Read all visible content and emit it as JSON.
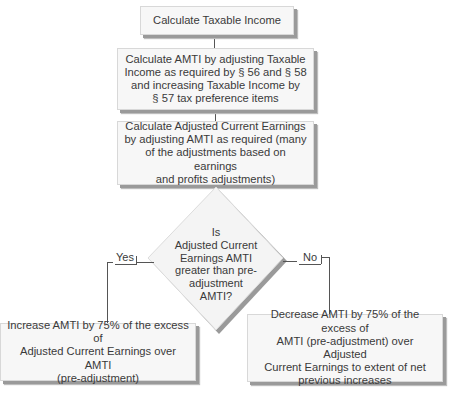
{
  "diagram": {
    "type": "flowchart",
    "nodes": {
      "step1": "Calculate Taxable Income",
      "step2_lines": [
        "Calculate AMTI by adjusting Taxable",
        "Income as required by § 56 and § 58",
        "and increasing Taxable Income by",
        "§ 57 tax preference items"
      ],
      "step3_lines": [
        "Calculate Adjusted Current Earnings",
        "by adjusting AMTI as required (many",
        "of the adjustments based on earnings",
        "and profits adjustments)"
      ],
      "decision_lines": [
        "Is",
        "Adjusted Current",
        "Earnings AMTI",
        "greater than pre-",
        "adjustment",
        "AMTI?"
      ],
      "yes_outcome_lines": [
        "Increase AMTI by 75% of the excess of",
        "Adjusted Current Earnings over AMTI",
        "(pre-adjustment)"
      ],
      "no_outcome_lines": [
        "Decrease AMTI by 75% of the excess of",
        "AMTI (pre-adjustment) over Adjusted",
        "Current Earnings to extent of net",
        "previous increases"
      ]
    },
    "branches": {
      "yes_label": "Yes",
      "no_label": "No"
    },
    "edges": [
      {
        "from": "step1",
        "to": "step2"
      },
      {
        "from": "step2",
        "to": "step3"
      },
      {
        "from": "step3",
        "to": "decision"
      },
      {
        "from": "decision",
        "to": "yes_outcome",
        "label": "Yes"
      },
      {
        "from": "decision",
        "to": "no_outcome",
        "label": "No"
      }
    ]
  }
}
